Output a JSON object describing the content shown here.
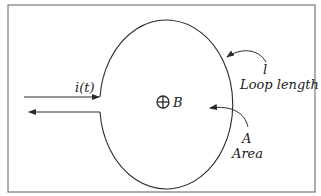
{
  "diagram": {
    "type": "current loop magnetic diagram",
    "current_label": "i(t)",
    "field_label": "B",
    "field_symbol": "into-page (⊕)",
    "loop_length_symbol": "l",
    "loop_length_text": "Loop length",
    "area_symbol": "A",
    "area_text": "Area"
  },
  "colors": {
    "line": "#2a2a2a",
    "frame": "#777777",
    "background": "#ffffff"
  }
}
